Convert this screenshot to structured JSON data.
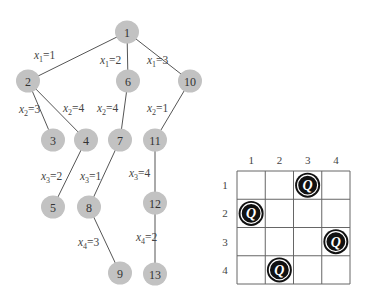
{
  "tree": {
    "nodes": [
      {
        "id": "1",
        "x": 127,
        "y": 32
      },
      {
        "id": "2",
        "x": 28,
        "y": 81
      },
      {
        "id": "6",
        "x": 128,
        "y": 81
      },
      {
        "id": "10",
        "x": 190,
        "y": 81
      },
      {
        "id": "3",
        "x": 53,
        "y": 140
      },
      {
        "id": "4",
        "x": 86,
        "y": 140
      },
      {
        "id": "7",
        "x": 120,
        "y": 140
      },
      {
        "id": "11",
        "x": 155,
        "y": 140
      },
      {
        "id": "5",
        "x": 53,
        "y": 207
      },
      {
        "id": "8",
        "x": 89,
        "y": 207
      },
      {
        "id": "12",
        "x": 155,
        "y": 203
      },
      {
        "id": "9",
        "x": 120,
        "y": 273
      },
      {
        "id": "13",
        "x": 155,
        "y": 274
      }
    ],
    "edges": [
      {
        "from": "1",
        "to": "2",
        "var": "x",
        "sub": "1",
        "val": "1",
        "lx": 34,
        "ly": 59
      },
      {
        "from": "1",
        "to": "6",
        "var": "x",
        "sub": "1",
        "val": "2",
        "lx": 100,
        "ly": 64
      },
      {
        "from": "1",
        "to": "10",
        "var": "x",
        "sub": "1",
        "val": "3",
        "lx": 147,
        "ly": 64
      },
      {
        "from": "2",
        "to": "3",
        "var": "x",
        "sub": "2",
        "val": "3",
        "lx": 19,
        "ly": 113
      },
      {
        "from": "2",
        "to": "4",
        "var": "x",
        "sub": "2",
        "val": "4",
        "lx": 63,
        "ly": 112
      },
      {
        "from": "6",
        "to": "7",
        "var": "x",
        "sub": "2",
        "val": "4",
        "lx": 97,
        "ly": 112
      },
      {
        "from": "10",
        "to": "11",
        "var": "x",
        "sub": "2",
        "val": "1",
        "lx": 147,
        "ly": 112
      },
      {
        "from": "4",
        "to": "5",
        "var": "x",
        "sub": "3",
        "val": "2",
        "lx": 41,
        "ly": 180
      },
      {
        "from": "7",
        "to": "8",
        "var": "x",
        "sub": "3",
        "val": "1",
        "lx": 80,
        "ly": 180
      },
      {
        "from": "11",
        "to": "12",
        "var": "x",
        "sub": "3",
        "val": "4",
        "lx": 129,
        "ly": 177
      },
      {
        "from": "8",
        "to": "9",
        "var": "x",
        "sub": "4",
        "val": "3",
        "lx": 78,
        "ly": 246
      },
      {
        "from": "12",
        "to": "13",
        "var": "x",
        "sub": "4",
        "val": "2",
        "lx": 136,
        "ly": 241
      }
    ]
  },
  "board": {
    "size": 4,
    "left": 237,
    "top": 171,
    "cell": 28.25,
    "column_labels": [
      "1",
      "2",
      "3",
      "4"
    ],
    "row_labels": [
      "1",
      "2",
      "3",
      "4"
    ],
    "queen_symbol": "Q",
    "queens": [
      {
        "row": 1,
        "col": 3
      },
      {
        "row": 2,
        "col": 1
      },
      {
        "row": 3,
        "col": 4
      },
      {
        "row": 4,
        "col": 2
      }
    ]
  },
  "colors": {
    "node_fill": "#c2c2c2",
    "edge": "#555555",
    "queen": "#111111"
  }
}
